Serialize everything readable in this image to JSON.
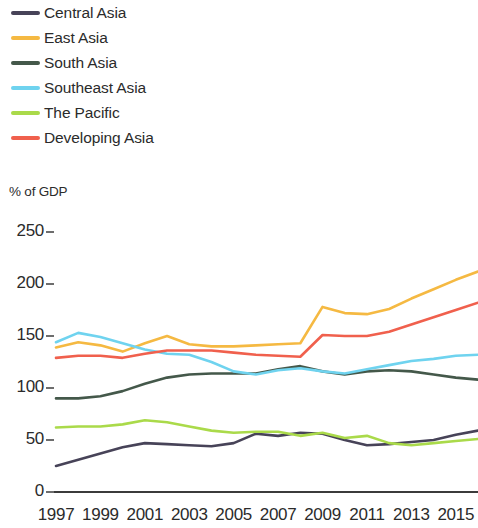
{
  "legend": {
    "position": "top-left",
    "items": [
      {
        "label": "Central Asia",
        "color": "#474358"
      },
      {
        "label": "East Asia",
        "color": "#f5b942"
      },
      {
        "label": "South Asia",
        "color": "#44584a"
      },
      {
        "label": "Southeast Asia",
        "color": "#6fd3ef"
      },
      {
        "label": "The Pacific",
        "color": "#aada4a"
      },
      {
        "label": "Developing Asia",
        "color": "#f0604d"
      }
    ]
  },
  "axis_title": "% of GDP",
  "y_ticks": [
    "250",
    "200",
    "150",
    "100",
    "50",
    "0"
  ],
  "x_ticks": [
    "1997",
    "1999",
    "2001",
    "2003",
    "2005",
    "2007",
    "2009",
    "2011",
    "2013",
    "2015"
  ],
  "chart_data": {
    "type": "line",
    "title": "",
    "subtitle": "",
    "xlabel": "",
    "ylabel": "% of GDP",
    "ylim": [
      0,
      250
    ],
    "xlim": [
      1997,
      2016
    ],
    "grid": false,
    "legend_position": "top-left",
    "y_tick_values": [
      250,
      200,
      150,
      100,
      50,
      0
    ],
    "x_tick_values": [
      1997,
      1999,
      2001,
      2003,
      2005,
      2007,
      2009,
      2011,
      2013,
      2015
    ],
    "x": [
      1997,
      1998,
      1999,
      2000,
      2001,
      2002,
      2003,
      2004,
      2005,
      2006,
      2007,
      2008,
      2009,
      2010,
      2011,
      2012,
      2013,
      2014,
      2015,
      2016
    ],
    "series": [
      {
        "name": "Central Asia",
        "color": "#474358",
        "values": [
          25,
          31,
          37,
          43,
          47,
          46,
          45,
          44,
          47,
          56,
          54,
          57,
          56,
          50,
          45,
          46,
          48,
          50,
          55,
          59
        ]
      },
      {
        "name": "East Asia",
        "color": "#f5b942",
        "values": [
          139,
          144,
          141,
          135,
          143,
          150,
          142,
          140,
          140,
          141,
          142,
          143,
          178,
          172,
          171,
          176,
          186,
          195,
          204,
          212
        ]
      },
      {
        "name": "South Asia",
        "color": "#44584a",
        "values": [
          90,
          90,
          92,
          97,
          104,
          110,
          113,
          114,
          114,
          114,
          118,
          121,
          116,
          113,
          116,
          117,
          116,
          113,
          110,
          108
        ]
      },
      {
        "name": "Southeast Asia",
        "color": "#6fd3ef",
        "values": [
          144,
          153,
          149,
          143,
          137,
          133,
          132,
          125,
          116,
          113,
          117,
          119,
          116,
          114,
          118,
          122,
          126,
          128,
          131,
          132
        ]
      },
      {
        "name": "The Pacific",
        "color": "#aada4a",
        "values": [
          62,
          63,
          63,
          65,
          69,
          67,
          63,
          59,
          57,
          58,
          58,
          54,
          57,
          52,
          54,
          47,
          45,
          47,
          49,
          51
        ]
      },
      {
        "name": "Developing Asia",
        "color": "#f0604d",
        "values": [
          129,
          131,
          131,
          129,
          133,
          136,
          136,
          136,
          134,
          132,
          131,
          130,
          151,
          150,
          150,
          154,
          161,
          168,
          175,
          182
        ]
      }
    ]
  },
  "plot_geometry": {
    "x_left_px": 56,
    "x_right_px": 478,
    "y_zero_px": 492,
    "y_top_px": 232,
    "y_top_value": 250
  }
}
